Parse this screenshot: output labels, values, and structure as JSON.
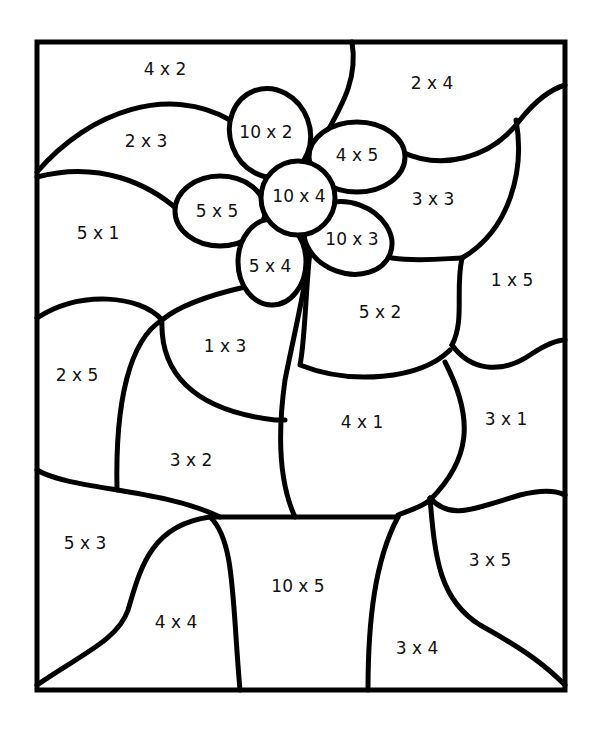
{
  "worksheet": {
    "title": "Color by multiplication - flower pot",
    "regions": {
      "top_left_sky": "4 x 2",
      "top_right_sky": "2 x 4",
      "left_cloud": "2 x 3",
      "left_middle": "5 x 1",
      "right_cloud": "3 x 3",
      "right_middle": "1 x 5",
      "petal_top": "10 x 2",
      "petal_top_right": "4 x 5",
      "flower_center": "10 x 4",
      "petal_left": "5 x 5",
      "petal_bottom_right": "10 x 3",
      "petal_bottom_left": "5 x 4",
      "leaf_left": "1 x 3",
      "leaf_right": "5 x 2",
      "left_lower": "2 x 5",
      "stem_left_area": "3 x 2",
      "leaf_bottom": "4 x 1",
      "right_lower": "3 x 1",
      "bottom_left": "5 x 3",
      "pot_left": "4 x 4",
      "pot": "10 x 5",
      "pot_right": "3 x 4",
      "bottom_right": "3 x 5"
    }
  }
}
